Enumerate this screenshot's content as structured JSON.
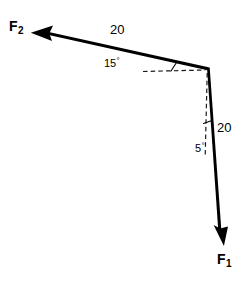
{
  "figure": {
    "type": "force-vector-diagram",
    "background_color": "#ffffff",
    "stroke_color": "#000000"
  },
  "labels": {
    "force_2": "F",
    "force_2_sub": "2",
    "force_1": "F",
    "force_1_sub": "1",
    "magnitude_f2": "20",
    "magnitude_f1": "20",
    "angle_f2": "15",
    "angle_f2_deg": "°",
    "angle_f1": "5",
    "angle_f1_deg": "°"
  },
  "geometry": {
    "origin": {
      "x": 208,
      "y": 68
    },
    "vectors": [
      {
        "name": "F2",
        "tip": {
          "x": 31,
          "y": 33
        },
        "magnitude": 20,
        "angle_deg": 15,
        "angle_reference": "horizontal-dashed-left",
        "direction": "up-and-to-the-left"
      },
      {
        "name": "F1",
        "tip": {
          "x": 224,
          "y": 245
        },
        "magnitude": 20,
        "angle_deg": 5,
        "angle_reference": "vertical-dashed-down",
        "direction": "down-and-slightly-right"
      }
    ],
    "reference_lines": [
      {
        "name": "horizontal-dashed",
        "from": {
          "x": 143,
          "y": 71
        },
        "to": {
          "x": 205,
          "y": 70
        },
        "style": "dashed"
      },
      {
        "name": "vertical-dashed",
        "from": {
          "x": 207,
          "y": 72
        },
        "to": {
          "x": 205,
          "y": 156
        },
        "style": "dashed"
      }
    ],
    "angle_ticks": [
      {
        "name": "tick-15",
        "x": 173,
        "y": 67
      },
      {
        "name": "tick-5",
        "x": 208,
        "y": 122
      }
    ]
  }
}
